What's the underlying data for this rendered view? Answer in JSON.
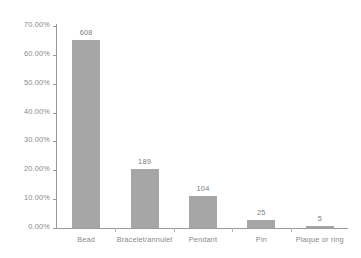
{
  "chart_data": {
    "type": "bar",
    "title": "",
    "subtitle": "",
    "xlabel": "",
    "ylabel": "",
    "categories": [
      "Bead",
      "Bracelet/annulet",
      "Pendant",
      "Pin",
      "Plaque or ring"
    ],
    "counts": [
      608,
      189,
      104,
      25,
      5
    ],
    "values": [
      65.31,
      20.3,
      11.17,
      2.69,
      0.54
    ],
    "data_labels": [
      "608",
      "189",
      "104",
      "25",
      "5"
    ],
    "ylim": [
      0,
      70
    ],
    "ytick_values": [
      70,
      60,
      50,
      40,
      30,
      20,
      10,
      0
    ],
    "ytick_labels": [
      "70.00%",
      "60.00%",
      "50.00%",
      "40.00%",
      "30.00%",
      "20.00%",
      "10.00%",
      "0.00%"
    ],
    "grid": false,
    "legend": null,
    "bar_color": "#a6a6a6",
    "axis_color": "#9a9a9a",
    "text_color": "#8a8a8a",
    "background_color": "#ffffff"
  }
}
